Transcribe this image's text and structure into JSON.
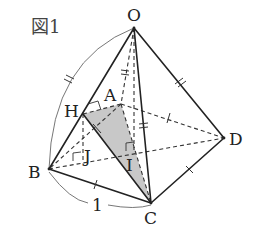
{
  "figure": {
    "title": "図1",
    "labels": {
      "O": "O",
      "A": "A",
      "B": "B",
      "C": "C",
      "D": "D",
      "H": "H",
      "I": "I",
      "J": "J",
      "length_BC": "1"
    },
    "colors": {
      "shade": "#c8c8c8",
      "line": "#222222",
      "arc": "#777777"
    },
    "vertices": {
      "O": [
        134,
        28
      ],
      "A": [
        121,
        104
      ],
      "B": [
        49,
        169
      ],
      "C": [
        151,
        203
      ],
      "D": [
        224,
        138
      ],
      "H": [
        83,
        114
      ],
      "I": [
        134,
        150
      ],
      "J": [
        83,
        159
      ]
    },
    "shaded_region": [
      "H",
      "A",
      "C"
    ],
    "solid_edges": [
      [
        "O",
        "B"
      ],
      [
        "O",
        "C"
      ],
      [
        "O",
        "D"
      ],
      [
        "B",
        "C"
      ],
      [
        "C",
        "D"
      ],
      [
        "H",
        "C"
      ]
    ],
    "dashed_edges": [
      [
        "O",
        "A"
      ],
      [
        "A",
        "D"
      ],
      [
        "A",
        "B"
      ],
      [
        "A",
        "C"
      ],
      [
        "B",
        "D"
      ],
      [
        "H",
        "A"
      ],
      [
        "H",
        "J"
      ],
      [
        "O",
        "I"
      ]
    ],
    "arcs": [
      {
        "from": "O",
        "to": "B",
        "marks": 2
      },
      {
        "from": "B",
        "to": "C",
        "label": "1"
      }
    ],
    "right_angles": [
      "H",
      "J",
      "I"
    ]
  }
}
